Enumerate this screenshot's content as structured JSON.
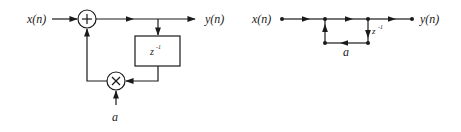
{
  "block_diagram": {
    "input_label": "x(n)",
    "output_label": "y(n)",
    "adder_symbol": "+",
    "multiplier_symbol": "×",
    "delay_label": "z",
    "delay_exponent": "-1",
    "coefficient_label": "a"
  },
  "signal_flow_graph": {
    "input_label": "x(n)",
    "output_label": "y(n)",
    "delay_label": "z",
    "delay_exponent": "-1",
    "coefficient_label": "a"
  }
}
